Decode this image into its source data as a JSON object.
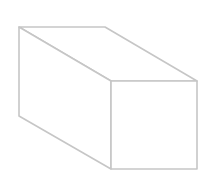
{
  "diagram": {
    "shape": "rectangular-prism",
    "stroke_color": "#c6c6c6",
    "background_color": "#ffffff",
    "stroke_width": 1.6,
    "vertices": {
      "back_top_left": [
        19,
        27
      ],
      "back_top_right": [
        105,
        27
      ],
      "front_top_left": [
        111,
        81
      ],
      "front_top_right": [
        197,
        81
      ],
      "back_bottom_left": [
        19,
        116
      ],
      "front_bottom_left": [
        111,
        169
      ],
      "front_bottom_right": [
        197,
        169
      ]
    },
    "faces": [
      {
        "name": "top-face",
        "points": "19,27 105,27 197,81 111,81"
      },
      {
        "name": "left-face",
        "points": "19,27 111,81 111,169 19,116"
      },
      {
        "name": "front-face",
        "points": "111,81 197,81 197,169 111,169"
      }
    ]
  }
}
